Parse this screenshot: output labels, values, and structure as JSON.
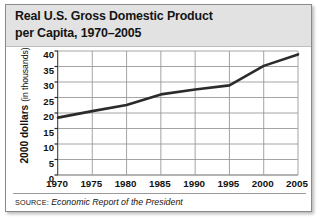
{
  "figure": {
    "title": "Real U.S. Gross Domestic Product\nper Capita, 1970–2005",
    "source_label": "SOURCE:",
    "source_text": "Economic Report of the President",
    "ylabel_main": "2000 dollars",
    "ylabel_unit": "(in thousands)"
  },
  "colors": {
    "title_band": "#e2e2e2",
    "line": "#2b2b2b",
    "grid": "#9a9a9a",
    "axis": "#2b2b2b",
    "text": "#141414",
    "frame": "#8a8a8a"
  },
  "chart_data": {
    "type": "line",
    "title": "Real U.S. Gross Domestic Product per Capita, 1970–2005",
    "xlabel": "",
    "ylabel": "2000 dollars (in thousands)",
    "x": [
      1970,
      1975,
      1980,
      1985,
      1990,
      1995,
      2000,
      2005
    ],
    "values": [
      18.5,
      20.6,
      22.6,
      26.0,
      27.6,
      28.9,
      35.2,
      38.9
    ],
    "series": [
      {
        "name": "Real GDP per capita",
        "values": [
          18.5,
          20.6,
          22.6,
          26.0,
          27.6,
          28.9,
          35.2,
          38.9
        ]
      }
    ],
    "xticks": [
      1970,
      1975,
      1980,
      1985,
      1990,
      1995,
      2000,
      2005
    ],
    "xtick_labels": [
      "1970",
      "1975",
      "1980",
      "1985",
      "1990",
      "1995",
      "2000",
      "2005"
    ],
    "yticks": [
      0,
      5,
      10,
      15,
      20,
      25,
      30,
      35,
      40
    ],
    "ytick_labels": [
      "0",
      "5",
      "10",
      "15",
      "20",
      "25",
      "30",
      "35",
      "40"
    ],
    "xlim": [
      1970,
      2005
    ],
    "ylim": [
      0,
      40
    ],
    "grid": true,
    "legend": false,
    "legend_position": "none"
  }
}
